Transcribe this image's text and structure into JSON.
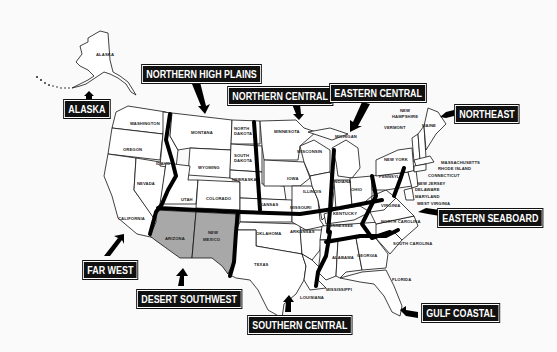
{
  "regions": [
    {
      "id": "alaska",
      "label": "ALASKA"
    },
    {
      "id": "northern-high-plains",
      "label": "NORTHERN HIGH PLAINS"
    },
    {
      "id": "northern-central",
      "label": "NORTHERN CENTRAL"
    },
    {
      "id": "eastern-central",
      "label": "EASTERN CENTRAL"
    },
    {
      "id": "northeast",
      "label": "NORTHEAST"
    },
    {
      "id": "eastern-seaboard",
      "label": "EASTERN SEABOARD"
    },
    {
      "id": "far-west",
      "label": "FAR WEST"
    },
    {
      "id": "desert-southwest",
      "label": "DESERT SOUTHWEST"
    },
    {
      "id": "southern-central",
      "label": "SOUTHERN CENTRAL"
    },
    {
      "id": "gulf-coastal",
      "label": "GULF COASTAL"
    }
  ],
  "states": {
    "alaska": "ALASKA",
    "washington": "WASHINGTON",
    "oregon": "OREGON",
    "idaho": "IDAHO",
    "montana": "MONTANA",
    "wyoming": "WYOMING",
    "nevada": "NEVADA",
    "california": "CALIFORNIA",
    "utah": "UTAH",
    "colorado": "COLORADO",
    "arizona": "ARIZONA",
    "new_mexico_1": "NEW",
    "new_mexico_2": "MEXICO",
    "north_dakota_1": "NORTH",
    "north_dakota_2": "DAKOTA",
    "south_dakota_1": "SOUTH",
    "south_dakota_2": "DAKOTA",
    "nebraska": "NEBRASKA",
    "kansas": "KANSAS",
    "oklahoma": "OKLAHOMA",
    "texas": "TEXAS",
    "minnesota": "MINNESOTA",
    "iowa": "IOWA",
    "missouri": "MISSOURI",
    "arkansas": "ARKANSAS",
    "louisiana": "LOUISIANA",
    "wisconsin": "WISCONSIN",
    "illinois": "ILLINOIS",
    "michigan": "MICHIGAN",
    "indiana": "INDIANA",
    "ohio": "OHIO",
    "kentucky": "KENTUCKY",
    "tennessee": "TENNESSEE",
    "mississippi": "MISSISSIPPI",
    "alabama": "ALABAMA",
    "georgia": "GEORGIA",
    "florida": "FLORIDA",
    "south_carolina": "SOUTH CAROLINA",
    "north_carolina": "NORTH CAROLINA",
    "virginia": "VIRGINIA",
    "west_virginia": "WEST VIRGINIA",
    "pennsylvania": "PENNSYL.",
    "new_york": "NEW YORK",
    "vermont": "VERMONT",
    "new_hampshire_1": "NEW",
    "new_hampshire_2": "HAMPSHIRE",
    "maine": "MAINE",
    "massachusetts": "MASSACHUSETTS",
    "rhode_island": "RHODE ISLAND",
    "connecticut": "CONNECTICUT",
    "new_jersey": "NEW JERSEY",
    "delaware": "DELAWARE",
    "maryland": "MARYLAND"
  },
  "colors": {
    "label_bg": "#111111",
    "label_text": "#ffffff",
    "shaded_region": "#a8a8a8",
    "background": "#fafafa"
  }
}
